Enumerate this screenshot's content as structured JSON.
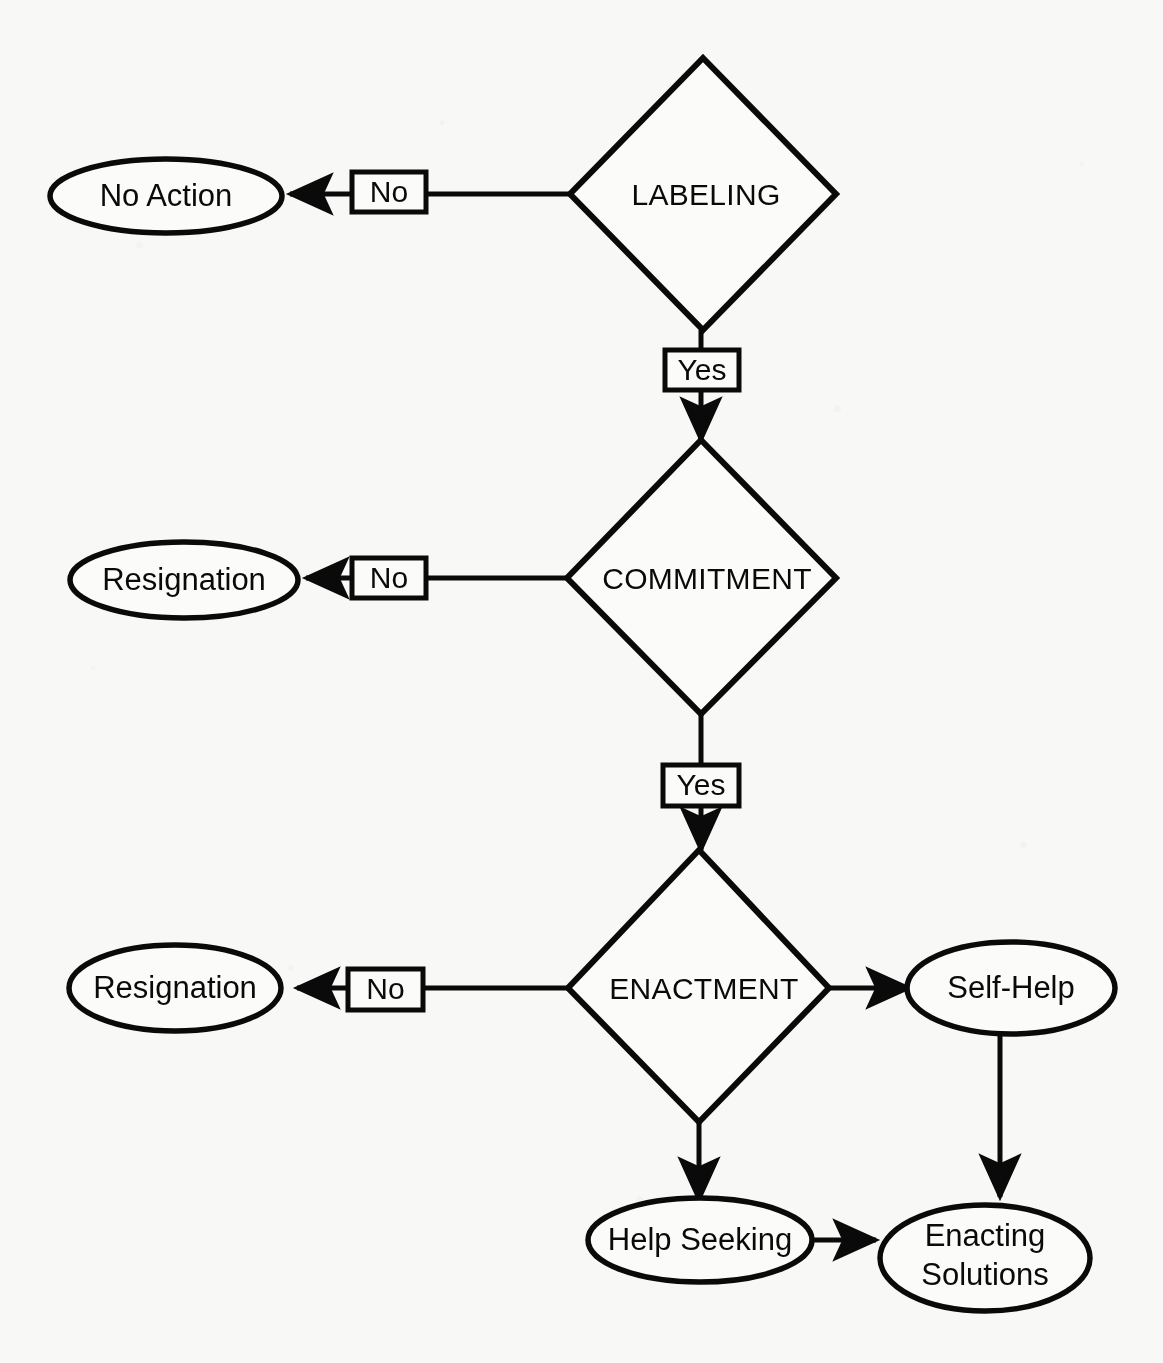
{
  "figure": {
    "type": "flowchart",
    "title": "",
    "cut_off_header_fragment": "",
    "background_color": "#f8f8f7",
    "line_color": "#0a0a0a",
    "text_color": "#0a0a0a"
  },
  "nodes": {
    "labeling": {
      "id": "labeling",
      "shape": "diamond",
      "label": "LABELING"
    },
    "commitment": {
      "id": "commitment",
      "shape": "diamond",
      "label": "COMMITMENT"
    },
    "enactment": {
      "id": "enactment",
      "shape": "diamond",
      "label": "ENACTMENT"
    },
    "no_action": {
      "id": "no_action",
      "shape": "ellipse",
      "label": "No Action"
    },
    "resignation_1": {
      "id": "resignation_1",
      "shape": "ellipse",
      "label": "Resignation"
    },
    "resignation_2": {
      "id": "resignation_2",
      "shape": "ellipse",
      "label": "Resignation"
    },
    "self_help": {
      "id": "self_help",
      "shape": "ellipse",
      "label": "Self-Help"
    },
    "help_seeking": {
      "id": "help_seeking",
      "shape": "ellipse",
      "label": "Help Seeking"
    },
    "enacting_solutions": {
      "id": "enacting_solutions",
      "shape": "ellipse",
      "label": "Enacting Solutions",
      "line1": "Enacting",
      "line2": "Solutions"
    }
  },
  "edge_labels": {
    "labeling_no": "No",
    "labeling_yes": "Yes",
    "commitment_no": "No",
    "commitment_yes": "Yes",
    "enactment_no": "No"
  },
  "edges": [
    {
      "from": "labeling",
      "to": "no_action",
      "label": "No",
      "direction": "left"
    },
    {
      "from": "labeling",
      "to": "commitment",
      "label": "Yes",
      "direction": "down"
    },
    {
      "from": "commitment",
      "to": "resignation_1",
      "label": "No",
      "direction": "left"
    },
    {
      "from": "commitment",
      "to": "enactment",
      "label": "Yes",
      "direction": "down"
    },
    {
      "from": "enactment",
      "to": "resignation_2",
      "label": "No",
      "direction": "left"
    },
    {
      "from": "enactment",
      "to": "self_help",
      "label": "",
      "direction": "right"
    },
    {
      "from": "enactment",
      "to": "help_seeking",
      "label": "",
      "direction": "down"
    },
    {
      "from": "self_help",
      "to": "enacting_solutions",
      "label": "",
      "direction": "down"
    },
    {
      "from": "help_seeking",
      "to": "enacting_solutions",
      "label": "",
      "direction": "right"
    }
  ]
}
